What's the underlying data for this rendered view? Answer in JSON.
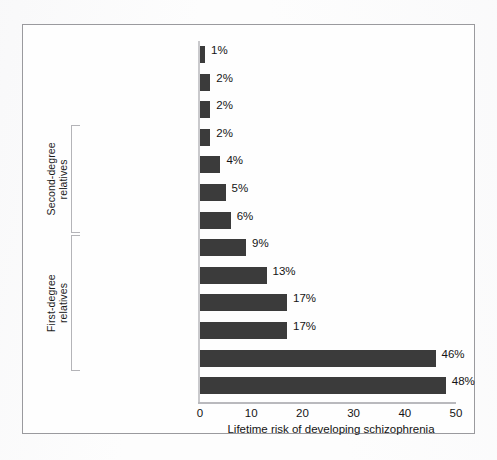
{
  "figure": {
    "frame_color": "#9a9a9e",
    "background": "#fdfdfd",
    "bar_color": "#3b3b3b"
  },
  "chart_data": {
    "type": "bar",
    "orientation": "horizontal",
    "title": "",
    "xlabel": "Lifetime risk of developing schizophrenia",
    "ylabel": "",
    "xlim": [
      0,
      50
    ],
    "xticks": [
      0,
      10,
      20,
      30,
      40,
      50
    ],
    "xtick_labels": [
      "0",
      "10",
      "20",
      "30",
      "40",
      "50"
    ],
    "grid": false,
    "legend": false,
    "value_suffix": "%",
    "categories": [
      "General population",
      "Spouses of patients",
      "First cousins\n(third degree)",
      "Uncles/aunts",
      "Nephews/nieces",
      "Grandchildren",
      "Half siblings",
      "Siblings",
      "Child of 1 parent\nwith schizophrenia",
      "Siblings with 1 parent\nwith schizophrenia",
      "Fraternal twins",
      "Child of 2 parents\nwith schizophrenia",
      "Identical twins"
    ],
    "values": [
      1,
      2,
      2,
      2,
      4,
      5,
      6,
      9,
      13,
      17,
      17,
      46,
      48
    ],
    "value_labels": [
      "1%",
      "2%",
      "2%",
      "2%",
      "4%",
      "5%",
      "6%",
      "9%",
      "13%",
      "17%",
      "17%",
      "46%",
      "48%"
    ],
    "groups": [
      {
        "label": "Second-degree\nrelatives",
        "from_index": 3,
        "to_index": 6
      },
      {
        "label": "First-degree\nrelatives",
        "from_index": 7,
        "to_index": 11
      }
    ]
  }
}
